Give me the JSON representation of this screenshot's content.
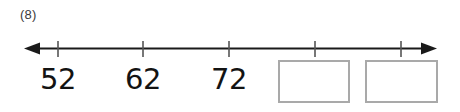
{
  "worksheet": {
    "item_number": "(8)",
    "numberline": {
      "axis_color": "#1a1a1a",
      "tick_color": "#555555",
      "left_arrow": "arrow-left",
      "right_arrow": "arrow-right",
      "tick_count": 5,
      "tick_positions_px": [
        58,
        143,
        229,
        315,
        401
      ],
      "axis_y_px": 48,
      "axis_start_px": 24,
      "axis_end_px": 437
    },
    "labels": [
      {
        "value": "52",
        "tick_index": 0,
        "x_center_px": 58
      },
      {
        "value": "62",
        "tick_index": 1,
        "x_center_px": 143
      },
      {
        "value": "72",
        "tick_index": 2,
        "x_center_px": 229
      }
    ],
    "answer_boxes": [
      {
        "value": "",
        "tick_index": 3,
        "left_px": 278,
        "width_px": 72,
        "border_color": "#a9a9a9"
      },
      {
        "value": "",
        "tick_index": 4,
        "left_px": 365,
        "width_px": 73,
        "border_color": "#a9a9a9"
      }
    ]
  }
}
